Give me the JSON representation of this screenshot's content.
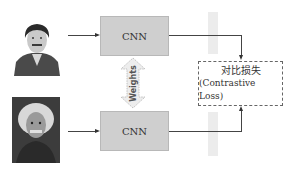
{
  "diagram": {
    "type": "siamese-network",
    "inputs": [
      {
        "id": "photo-top",
        "description": "portrait photo of young Einstein (grayscale)"
      },
      {
        "id": "photo-bottom",
        "description": "portrait photo of older Einstein (grayscale)"
      }
    ],
    "encoders": [
      {
        "id": "cnn-top",
        "label": "CNN"
      },
      {
        "id": "cnn-bottom",
        "label": "CNN"
      }
    ],
    "shared": {
      "label": "Weights"
    },
    "loss": {
      "label_zh": "对比损失",
      "label_en": "(Contrastive Loss)"
    },
    "colors": {
      "cnn_fill": "#cfcfcf",
      "feature_fill": "#ececec",
      "line": "#444444",
      "weights_arrow": "#e8e8e8"
    }
  }
}
